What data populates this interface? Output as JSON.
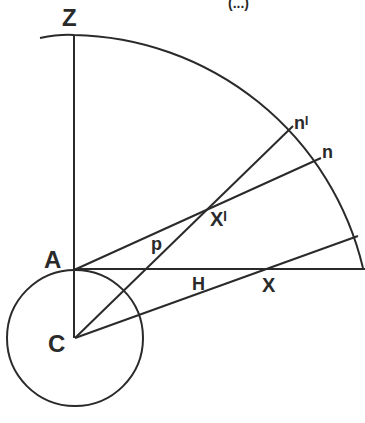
{
  "header": {
    "partial_text": "(...)"
  },
  "labels": {
    "Z": "Z",
    "A": "A",
    "C": "C",
    "H": "H",
    "X": "X",
    "X_prime": "Xᴵ",
    "p": "p",
    "n": "n",
    "n_prime": "nᴵ"
  },
  "colors": {
    "stroke": "#2a2a2a",
    "background": "#ffffff"
  }
}
